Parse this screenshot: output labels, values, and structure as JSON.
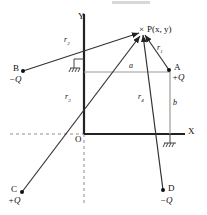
{
  "figure": {
    "type": "physics-diagram"
  },
  "axes": {
    "y_label": "Y",
    "x_label": "X",
    "origin_label": "O"
  },
  "point_p": {
    "marker": "×",
    "label": "P(x, y)",
    "name": "P"
  },
  "charges": [
    {
      "id": "A",
      "label": "A",
      "charge": "+Q",
      "sign": "+"
    },
    {
      "id": "B",
      "label": "B",
      "charge": "−Q",
      "sign": "−"
    },
    {
      "id": "C",
      "label": "C",
      "charge": "+Q",
      "sign": "+"
    },
    {
      "id": "D",
      "label": "D",
      "charge": "−Q",
      "sign": "−"
    }
  ],
  "distances": [
    {
      "id": "r1",
      "base": "r",
      "sub": "1"
    },
    {
      "id": "r2",
      "base": "r",
      "sub": "2"
    },
    {
      "id": "r3",
      "base": "r",
      "sub": "3"
    },
    {
      "id": "r4",
      "base": "r",
      "sub": "4"
    }
  ],
  "dimensions": [
    {
      "id": "a",
      "label": "a"
    },
    {
      "id": "b",
      "label": "b"
    }
  ],
  "colors": {
    "stroke": "#222222",
    "light_stroke": "#9a9a9a",
    "dashed": "#8c8c8c",
    "background": "#ffffff"
  }
}
